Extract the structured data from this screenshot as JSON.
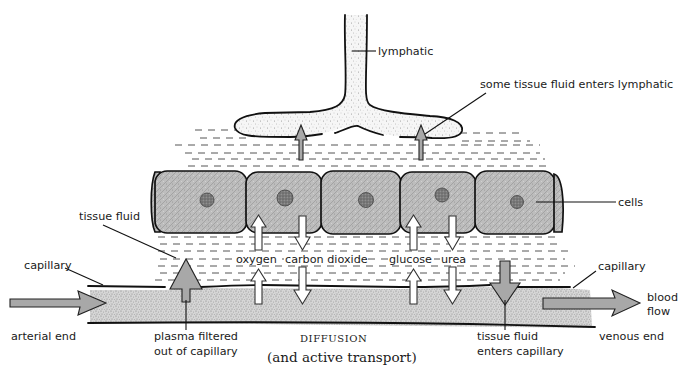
{
  "diagram": {
    "labels": {
      "lymphatic": "lymphatic",
      "lymph_entry": "some tissue fluid enters lymphatic",
      "cells": "cells",
      "tissue_fluid": "tissue fluid",
      "capillary_left": "capillary",
      "capillary_right": "capillary",
      "blood_flow_line1": "blood",
      "blood_flow_line2": "flow",
      "arterial_end": "arterial end",
      "venous_end": "venous end",
      "plasma_filtered_line1": "plasma filtered",
      "plasma_filtered_line2": "out of capillary",
      "tissue_fluid_enters_line1": "tissue fluid",
      "tissue_fluid_enters_line2": "enters capillary",
      "diffusion": "DIFFUSION",
      "active_transport": "(and active transport)"
    },
    "substances": [
      {
        "name": "oxygen",
        "direction": "capillary to cells"
      },
      {
        "name": "carbon dioxide",
        "direction": "cells to capillary"
      },
      {
        "name": "glucose",
        "direction": "capillary to cells"
      },
      {
        "name": "urea",
        "direction": "cells to capillary"
      }
    ],
    "colors": {
      "grey_arrow_fill": "#a8a8a8",
      "cell_fill": "#b4b4b4",
      "blood_stipple": "#9a9a9a",
      "outline": "#111111"
    }
  }
}
